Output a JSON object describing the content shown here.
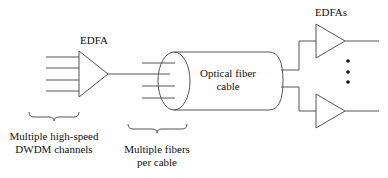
{
  "diagram": {
    "labels": {
      "edfa": "EDFA",
      "edfas": "EDFAs",
      "cable_line1": "Optical fiber",
      "cable_line2": "cable",
      "channels_line1": "Multiple high-speed",
      "channels_line2": "DWDM channels",
      "fibers_line1": "Multiple fibers",
      "fibers_line2": "per cable"
    },
    "components": [
      {
        "type": "amplifier",
        "name": "EDFA"
      },
      {
        "type": "cable",
        "name": "Optical fiber cable"
      },
      {
        "type": "amplifier",
        "name": "EDFA (upper)"
      },
      {
        "type": "amplifier",
        "name": "EDFA (lower)"
      }
    ],
    "input_channels": 4,
    "fibers_per_cable_shown": 4,
    "ellipsis": "vertical-dots",
    "colors": {
      "stroke": "#555555",
      "text": "#111111",
      "background": "#ffffff"
    }
  }
}
